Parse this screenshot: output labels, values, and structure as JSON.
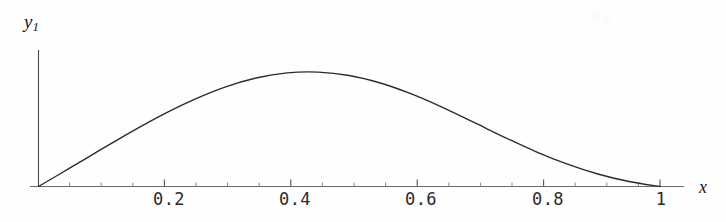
{
  "figure": {
    "title": "",
    "background_color": "#fefefe",
    "curve_color": "#2b2b2b",
    "axis_color": "#555555"
  },
  "axes": {
    "x_label": "x",
    "y_label": "y",
    "y_label_subscript": "1",
    "x_tick_labels": [
      "0.2",
      "0.4",
      "0.6",
      "0.8",
      "1"
    ],
    "x_tick_values": [
      0.2,
      0.4,
      0.6,
      0.8,
      1.0
    ]
  },
  "chart_data": {
    "type": "line",
    "title": "",
    "xlabel": "x",
    "ylabel": "y1",
    "xlim": [
      0,
      1.03
    ],
    "ylim": [
      0,
      1.0
    ],
    "grid": false,
    "legend": null,
    "axis_style": "single-x-axis-with-ticks-below, vertical-y-axis-no-ticks",
    "x_ticks_major": [
      0.2,
      0.4,
      0.6,
      0.8,
      1.0
    ],
    "x_ticks_minor": [
      0.05,
      0.1,
      0.15,
      0.25,
      0.3,
      0.35,
      0.45,
      0.5,
      0.55,
      0.65,
      0.7,
      0.75,
      0.85,
      0.9,
      0.95
    ],
    "x_tick_labels": [
      "0.2",
      "0.4",
      "0.6",
      "0.8",
      "1"
    ],
    "y_ticks": [],
    "y_tick_labels": [],
    "series": [
      {
        "name": "y1",
        "color": "#2b2b2b",
        "linewidth": 1.4,
        "x": [
          0.0,
          0.05,
          0.1,
          0.15,
          0.2,
          0.25,
          0.3,
          0.35,
          0.4,
          0.45,
          0.5,
          0.55,
          0.6,
          0.65,
          0.7,
          0.75,
          0.8,
          0.85,
          0.9,
          0.95,
          1.0
        ],
        "y": [
          0.0,
          0.139,
          0.28,
          0.418,
          0.547,
          0.661,
          0.756,
          0.825,
          0.864,
          0.87,
          0.844,
          0.787,
          0.704,
          0.602,
          0.489,
          0.374,
          0.266,
          0.172,
          0.095,
          0.038,
          0.0
        ]
      }
    ],
    "peak": {
      "x": 0.4,
      "y": 0.87
    },
    "endpoints": [
      {
        "x": 0.0,
        "y": 0.0
      },
      {
        "x": 1.0,
        "y": 0.0
      }
    ]
  }
}
